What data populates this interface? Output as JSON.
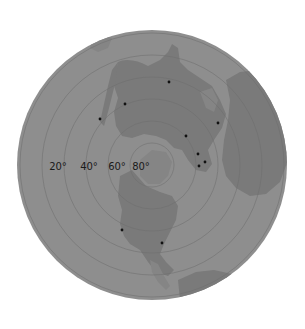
{
  "map": {
    "projection": "polar azimuthal (north pole centered)",
    "colors": {
      "background": "#ffffff",
      "ocean": "#8e8e8e",
      "land": "#7a7a7a",
      "land_light": "#858585",
      "grid": "#6e6e6e",
      "marker": "#111111",
      "label": "#1a1a1a"
    },
    "latitude_labels": [
      {
        "text": "20°",
        "x": 58,
        "y": 170
      },
      {
        "text": "40°",
        "x": 89,
        "y": 170
      },
      {
        "text": "60°",
        "x": 117,
        "y": 170
      },
      {
        "text": "80°",
        "x": 141,
        "y": 170
      }
    ],
    "markers": [
      {
        "id": "m1",
        "x": 169,
        "y": 82
      },
      {
        "id": "m2",
        "x": 125,
        "y": 104
      },
      {
        "id": "m3",
        "x": 100,
        "y": 119
      },
      {
        "id": "m4",
        "x": 218,
        "y": 123
      },
      {
        "id": "m5",
        "x": 186,
        "y": 136
      },
      {
        "id": "m6",
        "x": 198,
        "y": 154
      },
      {
        "id": "m7",
        "x": 205,
        "y": 162
      },
      {
        "id": "m8",
        "x": 199,
        "y": 166
      },
      {
        "id": "m9",
        "x": 122,
        "y": 230
      },
      {
        "id": "m10",
        "x": 162,
        "y": 243
      }
    ]
  }
}
